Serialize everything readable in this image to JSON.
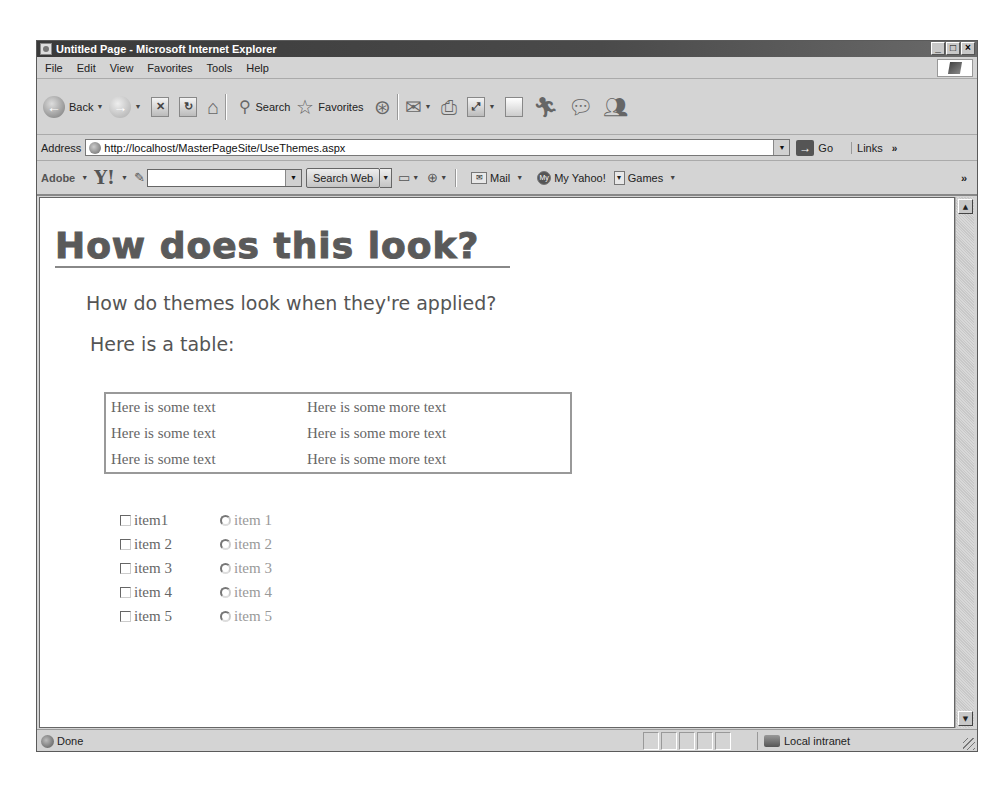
{
  "window": {
    "title": "Untitled Page - Microsoft Internet Explorer",
    "controls": {
      "minimize": "_",
      "maximize": "□",
      "close": "×"
    }
  },
  "menu": {
    "items": [
      "File",
      "Edit",
      "View",
      "Favorites",
      "Tools",
      "Help"
    ]
  },
  "toolbar": {
    "back_label": "Back",
    "search_label": "Search",
    "favorites_label": "Favorites"
  },
  "address": {
    "label": "Address",
    "url": "http://localhost/MasterPageSite/UseThemes.aspx",
    "go_label": "Go",
    "links_label": "Links",
    "links_chevron": "»"
  },
  "yahoo_toolbar": {
    "adobe_label": "Adobe",
    "yahoo_logo": "Y!",
    "search_value": "",
    "search_button": "Search Web",
    "mail_label": "Mail",
    "my_yahoo_label": "My Yahoo!",
    "games_label": "Games",
    "chevron": "»"
  },
  "page": {
    "heading": "How does this look?",
    "subheading": "How do themes look when they're applied?",
    "table_intro": "Here is a table:",
    "table": {
      "rows": [
        [
          "Here is some text",
          "Here is some more text"
        ],
        [
          "Here is some text",
          "Here is some more text"
        ],
        [
          "Here is some text",
          "Here is some more text"
        ]
      ]
    },
    "checkboxes": [
      {
        "label": "item1",
        "checked": false
      },
      {
        "label": "item 2",
        "checked": false
      },
      {
        "label": "item 3",
        "checked": false
      },
      {
        "label": "item 4",
        "checked": false
      },
      {
        "label": "item 5",
        "checked": false
      }
    ],
    "radios": [
      {
        "label": "item 1",
        "selected": false
      },
      {
        "label": "item 2",
        "selected": false
      },
      {
        "label": "item 3",
        "selected": false
      },
      {
        "label": "item 4",
        "selected": false
      },
      {
        "label": "item 5",
        "selected": false
      }
    ]
  },
  "status": {
    "text": "Done",
    "zone": "Local intranet"
  }
}
